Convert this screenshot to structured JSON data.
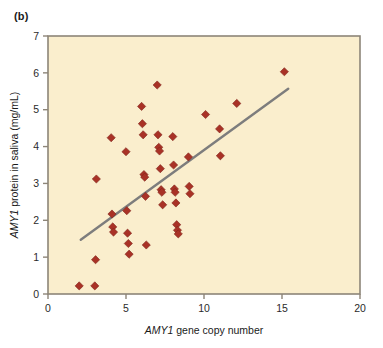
{
  "figure": {
    "panel_label": "(b)",
    "background_color": "#ffffff",
    "plot_background_color": "#faeecd",
    "frame_color": "#8d8578",
    "marker_color": "#a93226",
    "marker_edge_color": "#7e241b",
    "trendline_color": "#7d7d7d"
  },
  "chart_data": {
    "type": "scatter",
    "title": "",
    "xlabel_italic": "AMY1",
    "xlabel_rest": " gene copy number",
    "xlabel": "AMY1 gene copy number",
    "ylabel_italic": "AMY1",
    "ylabel_rest": " protein in saliva (mg/mL)",
    "ylabel": "AMY1 protein in saliva (mg/mL)",
    "xlim": [
      0,
      20
    ],
    "ylim": [
      0,
      7
    ],
    "xticks": [
      0,
      5,
      10,
      15,
      20
    ],
    "yticks": [
      0,
      1,
      2,
      3,
      4,
      5,
      6,
      7
    ],
    "xtick_labels": [
      "0",
      "5",
      "10",
      "15",
      "20"
    ],
    "ytick_labels": [
      "0",
      "1",
      "2",
      "3",
      "4",
      "5",
      "6",
      "7"
    ],
    "grid": false,
    "legend": false,
    "marker": "diamond",
    "points": [
      {
        "x": 2.0,
        "y": 0.22
      },
      {
        "x": 3.0,
        "y": 0.22
      },
      {
        "x": 3.05,
        "y": 0.93
      },
      {
        "x": 3.1,
        "y": 3.12
      },
      {
        "x": 4.05,
        "y": 4.24
      },
      {
        "x": 4.1,
        "y": 2.17
      },
      {
        "x": 4.15,
        "y": 1.82
      },
      {
        "x": 4.2,
        "y": 1.68
      },
      {
        "x": 5.0,
        "y": 3.86
      },
      {
        "x": 5.05,
        "y": 2.26
      },
      {
        "x": 5.1,
        "y": 1.65
      },
      {
        "x": 5.15,
        "y": 1.37
      },
      {
        "x": 5.2,
        "y": 1.08
      },
      {
        "x": 6.0,
        "y": 5.09
      },
      {
        "x": 6.05,
        "y": 4.62
      },
      {
        "x": 6.1,
        "y": 4.32
      },
      {
        "x": 6.15,
        "y": 3.24
      },
      {
        "x": 6.2,
        "y": 3.17
      },
      {
        "x": 6.25,
        "y": 2.65
      },
      {
        "x": 6.3,
        "y": 1.33
      },
      {
        "x": 7.0,
        "y": 5.67
      },
      {
        "x": 7.05,
        "y": 4.32
      },
      {
        "x": 7.1,
        "y": 3.98
      },
      {
        "x": 7.15,
        "y": 3.88
      },
      {
        "x": 7.2,
        "y": 3.4
      },
      {
        "x": 7.25,
        "y": 2.83
      },
      {
        "x": 7.3,
        "y": 2.76
      },
      {
        "x": 7.35,
        "y": 2.42
      },
      {
        "x": 8.0,
        "y": 4.27
      },
      {
        "x": 8.05,
        "y": 3.5
      },
      {
        "x": 8.1,
        "y": 2.85
      },
      {
        "x": 8.15,
        "y": 2.76
      },
      {
        "x": 8.2,
        "y": 2.47
      },
      {
        "x": 8.25,
        "y": 1.88
      },
      {
        "x": 8.3,
        "y": 1.73
      },
      {
        "x": 8.35,
        "y": 1.63
      },
      {
        "x": 9.0,
        "y": 3.72
      },
      {
        "x": 9.05,
        "y": 2.92
      },
      {
        "x": 9.1,
        "y": 2.72
      },
      {
        "x": 10.1,
        "y": 4.87
      },
      {
        "x": 11.0,
        "y": 4.48
      },
      {
        "x": 11.05,
        "y": 3.75
      },
      {
        "x": 12.1,
        "y": 5.17
      },
      {
        "x": 15.15,
        "y": 6.03
      }
    ],
    "trendline": {
      "x_start": 2.1,
      "y_start": 1.47,
      "x_end": 15.4,
      "y_end": 5.57
    },
    "n_points": 45
  }
}
